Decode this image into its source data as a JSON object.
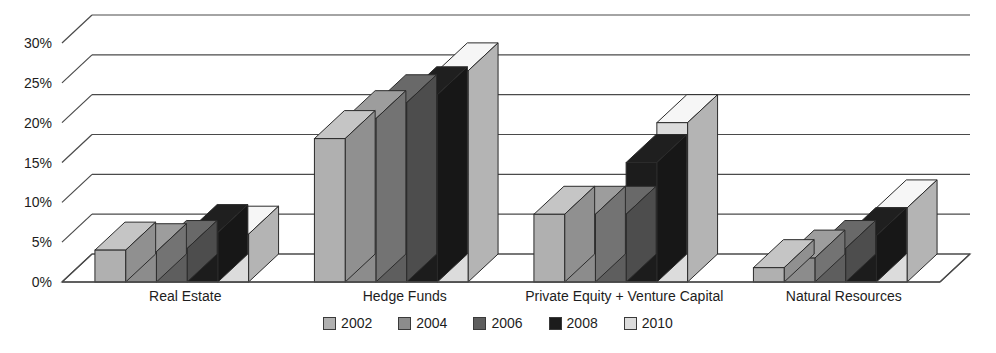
{
  "chart_data": {
    "type": "bar",
    "title": "",
    "subtitle": "",
    "xlabel": "",
    "ylabel": "",
    "categories": [
      "Real Estate",
      "Hedge Funds",
      "Private Equity + Venture Capital",
      "Natural Resources"
    ],
    "series": [
      {
        "name": "2002",
        "color": "#b0b0b0",
        "values": [
          4.0,
          18.0,
          8.5,
          1.8
        ]
      },
      {
        "name": "2004",
        "color": "#8c8c8c",
        "values": [
          3.8,
          20.5,
          8.5,
          3.0
        ]
      },
      {
        "name": "2006",
        "color": "#5e5e5e",
        "values": [
          4.2,
          22.5,
          8.5,
          4.2
        ]
      },
      {
        "name": "2008",
        "color": "#1c1c1c",
        "values": [
          6.2,
          23.5,
          15.0,
          5.8
        ]
      },
      {
        "name": "2010",
        "color": "#dcdcdc",
        "values": [
          6.0,
          26.5,
          20.0,
          9.3
        ]
      }
    ],
    "ylim": [
      0,
      30
    ],
    "yticks": [
      0,
      5,
      10,
      15,
      20,
      25,
      30
    ],
    "ytick_labels": [
      "0%",
      "5%",
      "10%",
      "15%",
      "20%",
      "25%",
      "30%"
    ],
    "grid": true,
    "legend_position": "bottom",
    "style": "3d-grouped-bar-grayscale"
  },
  "legend": {
    "items": [
      {
        "label": "2002",
        "color": "#b0b0b0"
      },
      {
        "label": "2004",
        "color": "#8c8c8c"
      },
      {
        "label": "2006",
        "color": "#5e5e5e"
      },
      {
        "label": "2008",
        "color": "#1c1c1c"
      },
      {
        "label": "2010",
        "color": "#dcdcdc"
      }
    ]
  }
}
